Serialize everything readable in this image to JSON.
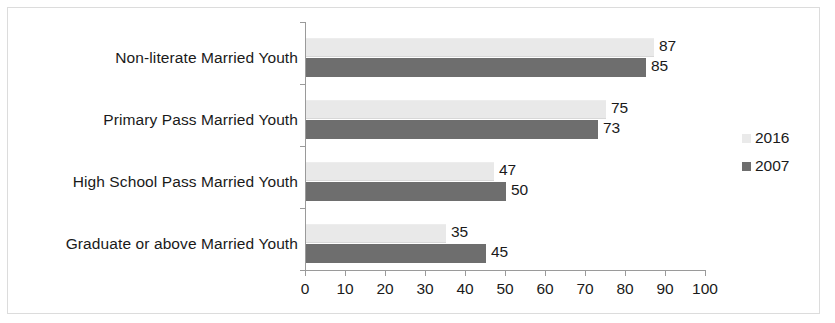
{
  "chart_data": {
    "type": "bar",
    "orientation": "horizontal",
    "title": "",
    "xlabel": "",
    "ylabel": "",
    "xlim": [
      0,
      100
    ],
    "xticks": [
      0,
      10,
      20,
      30,
      40,
      50,
      60,
      70,
      80,
      90,
      100
    ],
    "grid": false,
    "legend_position": "right",
    "categories": [
      "Non-literate Married Youth",
      "Primary Pass Married Youth",
      "High School Pass Married Youth",
      "Graduate or above Married Youth"
    ],
    "series": [
      {
        "name": "2016",
        "color": "#e9e9e9",
        "values": [
          87,
          75,
          47,
          35
        ]
      },
      {
        "name": "2007",
        "color": "#6e6e6e",
        "values": [
          85,
          73,
          50,
          45
        ]
      }
    ]
  },
  "legend": {
    "items": [
      {
        "label": "2016",
        "swatch": "legend-swatch-2016"
      },
      {
        "label": "2007",
        "swatch": "legend-swatch-2007"
      }
    ]
  }
}
